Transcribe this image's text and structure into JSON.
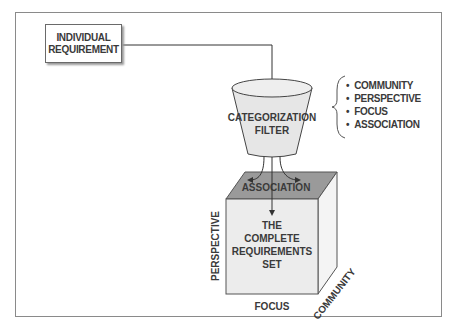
{
  "diagram": {
    "input_box": {
      "line1": "INDIVIDUAL",
      "line2": "REQUIREMENT"
    },
    "filter": {
      "line1": "CATEGORIZATION",
      "line2": "FILTER",
      "fill": "#e6e6e6"
    },
    "criteria": [
      "COMMUNITY",
      "PERSPECTIVE",
      "FOCUS",
      "ASSOCIATION"
    ],
    "cube": {
      "top_label": "ASSOCIATION",
      "front_lines": [
        "THE",
        "COMPLETE",
        "REQUIREMENTS",
        "SET"
      ],
      "axis_left": "PERSPECTIVE",
      "axis_bottom": "FOCUS",
      "axis_depth": "COMMUNITY",
      "top_fill": "#9a9a9a",
      "front_fill": "#ececec",
      "side_fill": "#f4f4f4"
    }
  }
}
